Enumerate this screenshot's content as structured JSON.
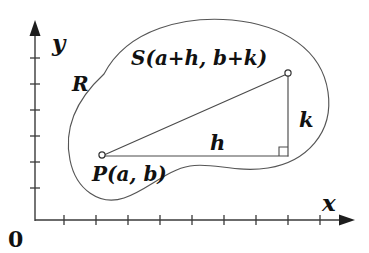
{
  "figure": {
    "background_color": "#ffffff",
    "ink_color": "#222222"
  },
  "axes": {
    "x_label": "x",
    "y_label": "y",
    "origin_label": "0",
    "x_axis": {
      "start_x": 35,
      "end_x": 355,
      "y": 220,
      "tick_count": 9,
      "tick_positions": [
        64,
        96,
        128,
        160,
        192,
        224,
        256,
        288,
        320
      ],
      "tick_half_length": 5,
      "arrow": "right"
    },
    "y_axis": {
      "x": 35,
      "start_y": 220,
      "end_y": 24,
      "tick_count": 6,
      "tick_positions": [
        188,
        162,
        136,
        110,
        84,
        58
      ],
      "tick_half_length": 5,
      "arrow": "up"
    }
  },
  "region": {
    "name": "R",
    "label": "R",
    "label_x": 72,
    "label_y": 84,
    "stroke_color": "#555555",
    "path": "M 104 74 C 128 28, 186 16, 232 20 C 284 25, 322 50, 328 92 C 334 133, 306 162, 268 168 C 236 173, 212 162, 190 166 C 166 170, 148 190, 124 198 C 100 206, 76 190, 70 160 C 63 126, 78 98, 104 74 Z"
  },
  "triangle": {
    "vertices": {
      "P": {
        "label": "P(a, b)",
        "x": 102,
        "y": 155,
        "label_x": 96,
        "label_y": 176
      },
      "S": {
        "label": "S(a+h, b+k)",
        "x": 288,
        "y": 73,
        "label_x": 133,
        "label_y": 58
      },
      "corner": {
        "x": 288,
        "y": 155
      }
    },
    "sides": {
      "horizontal_label": "h",
      "horizontal_label_x": 215,
      "horizontal_label_y": 148,
      "vertical_label": "k",
      "vertical_label_x": 303,
      "vertical_label_y": 120,
      "hypotenuse": "P to S"
    },
    "right_angle_marker": {
      "size": 9,
      "present": true
    },
    "vertex_marker_radius": 3.1
  }
}
